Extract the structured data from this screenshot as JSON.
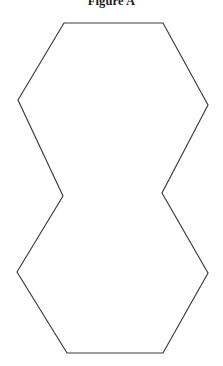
{
  "figure": {
    "title": "Figure A",
    "title_visible": true,
    "title_clipped_at_top": true,
    "background_color": "#ffffff",
    "stroke_color": "#3a3a3a",
    "fill_color": "#ffffff",
    "stroke_width": 1.15,
    "canvas": {
      "width": 223,
      "height": 366
    },
    "shape": {
      "name": "double-hexagon-pinched-waist",
      "description": "Two hexagons joined at a pinched waist forming an hourglass-like outline",
      "closed": true,
      "vertex_count": 10,
      "points": [
        {
          "name": "top-left-corner",
          "x": 64,
          "y": 23
        },
        {
          "name": "top-right-corner",
          "x": 163,
          "y": 23
        },
        {
          "name": "upper-right-point",
          "x": 208,
          "y": 105
        },
        {
          "name": "right-waist-notch",
          "x": 162,
          "y": 193
        },
        {
          "name": "lower-right-point",
          "x": 208,
          "y": 273
        },
        {
          "name": "bottom-right-corner",
          "x": 163,
          "y": 353
        },
        {
          "name": "bottom-left-corner",
          "x": 67,
          "y": 353
        },
        {
          "name": "lower-left-point",
          "x": 17,
          "y": 272
        },
        {
          "name": "left-waist-notch",
          "x": 63,
          "y": 196
        },
        {
          "name": "upper-left-point",
          "x": 18,
          "y": 100
        }
      ],
      "polygon_points": "64,23 163,23 208,105 162,193 208,273 163,353 67,353 17,272 63,196 18,100"
    }
  }
}
